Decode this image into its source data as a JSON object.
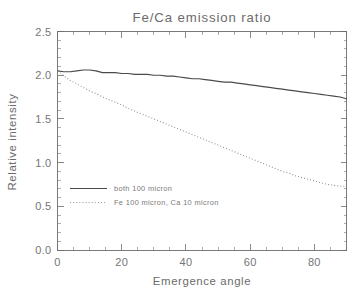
{
  "chart_data": {
    "type": "line",
    "title": "Fe/Ca emission ratio",
    "xlabel": "Emergence angle",
    "ylabel": "Relative intensity",
    "xlim": [
      0,
      90
    ],
    "ylim": [
      0.0,
      2.5
    ],
    "xticks": [
      0,
      20,
      40,
      60,
      80
    ],
    "xtick_labels": [
      "0",
      "20",
      "40",
      "60",
      "80"
    ],
    "yticks": [
      0.0,
      0.5,
      1.0,
      1.5,
      2.0,
      2.5
    ],
    "ytick_labels": [
      "0.0",
      "0.5",
      "1.0",
      "1.5",
      "2.0",
      "2.5"
    ],
    "grid": false,
    "minor_ticks": true,
    "tick_direction": "in",
    "box_frame": true,
    "legend_position": "center-left-inside",
    "series": [
      {
        "name": "both 100 micron",
        "style": "solid",
        "color": "#4a4a4a",
        "x": [
          0,
          2,
          4,
          6,
          8,
          10,
          12,
          14,
          16,
          18,
          20,
          22,
          24,
          26,
          28,
          30,
          32,
          34,
          36,
          38,
          40,
          42,
          44,
          46,
          48,
          50,
          52,
          54,
          56,
          58,
          60,
          62,
          64,
          66,
          68,
          70,
          72,
          74,
          76,
          78,
          80,
          82,
          84,
          86,
          88,
          90
        ],
        "y": [
          2.05,
          2.04,
          2.04,
          2.05,
          2.06,
          2.06,
          2.05,
          2.03,
          2.03,
          2.03,
          2.02,
          2.02,
          2.01,
          2.01,
          2.01,
          2.0,
          2.0,
          1.99,
          1.99,
          1.98,
          1.97,
          1.96,
          1.96,
          1.95,
          1.94,
          1.93,
          1.92,
          1.92,
          1.91,
          1.9,
          1.89,
          1.88,
          1.87,
          1.86,
          1.85,
          1.84,
          1.83,
          1.82,
          1.81,
          1.8,
          1.79,
          1.78,
          1.77,
          1.76,
          1.75,
          1.73
        ]
      },
      {
        "name": "Fe 100 micron, Ca 10 micron",
        "style": "dotted",
        "color": "#8d8d8d",
        "x": [
          0,
          2,
          4,
          6,
          8,
          10,
          12,
          14,
          16,
          18,
          20,
          22,
          24,
          26,
          28,
          30,
          32,
          34,
          36,
          38,
          40,
          42,
          44,
          46,
          48,
          50,
          52,
          54,
          56,
          58,
          60,
          62,
          64,
          66,
          68,
          70,
          72,
          74,
          76,
          78,
          80,
          82,
          84,
          86,
          88,
          90
        ],
        "y": [
          2.05,
          1.99,
          1.94,
          1.9,
          1.86,
          1.82,
          1.79,
          1.75,
          1.72,
          1.69,
          1.66,
          1.62,
          1.59,
          1.56,
          1.53,
          1.5,
          1.47,
          1.44,
          1.41,
          1.38,
          1.35,
          1.32,
          1.29,
          1.26,
          1.23,
          1.2,
          1.17,
          1.14,
          1.11,
          1.08,
          1.05,
          1.02,
          0.99,
          0.96,
          0.93,
          0.9,
          0.88,
          0.85,
          0.83,
          0.81,
          0.79,
          0.77,
          0.75,
          0.74,
          0.73,
          0.73
        ]
      }
    ]
  },
  "legend": {
    "entries": [
      {
        "label": "both 100 micron",
        "style": "solid"
      },
      {
        "label": "Fe 100 micron, Ca 10 micron",
        "style": "dotted"
      }
    ]
  }
}
